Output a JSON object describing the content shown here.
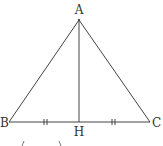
{
  "diagram": {
    "type": "isosceles-triangle-with-altitude",
    "points": {
      "A": {
        "label": "A",
        "x": 79,
        "y": 20
      },
      "B": {
        "label": "B",
        "x": 9,
        "y": 122
      },
      "C": {
        "label": "C",
        "x": 150,
        "y": 122
      },
      "H": {
        "label": "H",
        "x": 79,
        "y": 122
      }
    },
    "segments": [
      "AB",
      "AC",
      "BC",
      "AH"
    ],
    "equal_marks": [
      "BH",
      "HC"
    ],
    "line_color": "#444444"
  }
}
